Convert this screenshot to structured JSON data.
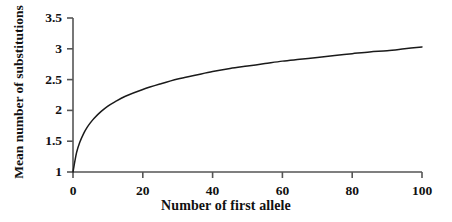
{
  "chart_data": {
    "type": "line",
    "title": "",
    "xlabel": "Number of first allele",
    "ylabel": "Mean number of substitutions",
    "xlim": [
      0,
      100
    ],
    "ylim": [
      1,
      3.5
    ],
    "xticks": [
      0,
      20,
      40,
      60,
      80,
      100
    ],
    "xtick_labels": [
      "0",
      "20",
      "40",
      "60",
      "80",
      "100"
    ],
    "yticks": [
      1,
      1.5,
      2,
      2.5,
      3,
      3.5
    ],
    "ytick_labels": [
      "1",
      "1.5",
      "2",
      "2.5",
      "3",
      "3.5"
    ],
    "grid": false,
    "legend": null,
    "line_color": "#1a1a1a",
    "axis_color": "#555555",
    "series": [
      {
        "name": "Mean number of substitutions",
        "x": [
          0,
          1,
          2,
          3,
          4,
          5,
          6,
          8,
          10,
          12,
          15,
          20,
          25,
          30,
          35,
          40,
          45,
          50,
          55,
          60,
          65,
          70,
          75,
          80,
          85,
          90,
          95,
          100
        ],
        "y": [
          1.0,
          1.31,
          1.49,
          1.62,
          1.72,
          1.8,
          1.87,
          1.98,
          2.07,
          2.14,
          2.23,
          2.34,
          2.43,
          2.51,
          2.57,
          2.63,
          2.68,
          2.72,
          2.76,
          2.8,
          2.83,
          2.86,
          2.89,
          2.92,
          2.95,
          2.97,
          3.0,
          3.03
        ]
      }
    ]
  },
  "figure": {
    "xaxis_title": "Number of first allele",
    "yaxis_title": "Mean number of substitutions"
  }
}
